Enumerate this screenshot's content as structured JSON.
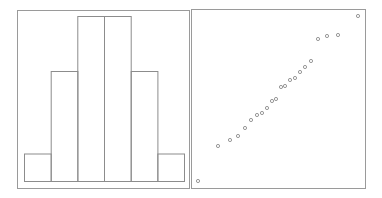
{
  "chart_data": [
    {
      "type": "bar",
      "subtype": "histogram",
      "title": "",
      "xlabel": "",
      "ylabel": "",
      "categories": [
        "bin1",
        "bin2",
        "bin3",
        "bin4",
        "bin5",
        "bin6"
      ],
      "values": [
        1,
        4,
        6,
        6,
        4,
        1
      ],
      "ylim": [
        0,
        6.5
      ],
      "grid": false,
      "axes_ticks": false,
      "legend": "none"
    },
    {
      "type": "scatter",
      "subtype": "qq-plot",
      "title": "",
      "xlabel": "",
      "ylabel": "",
      "marker": "open-circle",
      "grid": false,
      "axes_ticks": false,
      "legend": "none",
      "points_px": [
        [
          198,
          181
        ],
        [
          218,
          146
        ],
        [
          230,
          140
        ],
        [
          238,
          136
        ],
        [
          245,
          128
        ],
        [
          251,
          120
        ],
        [
          257,
          115
        ],
        [
          262,
          113
        ],
        [
          267,
          108
        ],
        [
          272,
          101
        ],
        [
          276,
          99
        ],
        [
          281,
          87
        ],
        [
          285,
          86
        ],
        [
          290,
          80
        ],
        [
          295,
          78
        ],
        [
          300,
          72
        ],
        [
          305,
          67
        ],
        [
          311,
          61
        ],
        [
          318,
          39
        ],
        [
          327,
          36
        ],
        [
          338,
          35
        ],
        [
          358,
          16
        ]
      ]
    }
  ],
  "colors": {
    "frame": "#9a9a9a",
    "bar_stroke": "#8c8c8c",
    "point_stroke": "#8c8c8c",
    "background": "#ffffff"
  }
}
